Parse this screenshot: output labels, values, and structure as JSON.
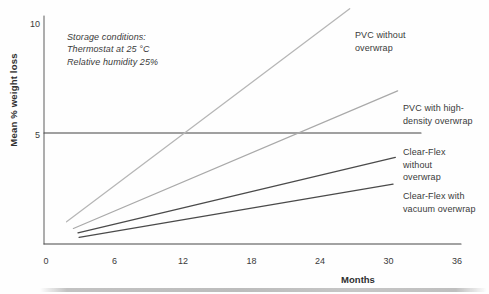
{
  "chart_data": {
    "type": "line",
    "title": "",
    "xlabel": "Months",
    "ylabel": "Mean % weight loss",
    "xlim": [
      0,
      36
    ],
    "ylim": [
      0,
      10
    ],
    "x_ticks": [
      0,
      6,
      12,
      18,
      24,
      30,
      36
    ],
    "y_ticks": [
      5,
      10
    ],
    "reference_line_y": 5,
    "grid": "single horizontal reference line at y=5 only",
    "legend_position": "labels at right end of each line",
    "annotation": "Storage conditions:\nThermostat at 25 °C\nRelative humidity 25%",
    "series": [
      {
        "name": "PVC without overwrap",
        "label": "PVC without\noverwrap",
        "color": "#b6b6b6",
        "points": [
          [
            1.8,
            1.0
          ],
          [
            26.6,
            10.6
          ]
        ]
      },
      {
        "name": "PVC with high-density overwrap",
        "label": "PVC with high-\ndensity overwrap",
        "color": "#a9a9a9",
        "points": [
          [
            2.4,
            0.7
          ],
          [
            30.8,
            6.9
          ]
        ]
      },
      {
        "name": "Clear-Flex without overwrap",
        "label": "Clear-Flex\nwithout\noverwrap",
        "color": "#4a4a4a",
        "points": [
          [
            2.8,
            0.5
          ],
          [
            30.6,
            3.9
          ]
        ]
      },
      {
        "name": "Clear-Flex with vacuum overwrap",
        "label": "Clear-Flex with\nvacuum overwrap",
        "color": "#4a4a4a",
        "points": [
          [
            2.9,
            0.3
          ],
          [
            30.4,
            2.7
          ]
        ]
      }
    ]
  }
}
